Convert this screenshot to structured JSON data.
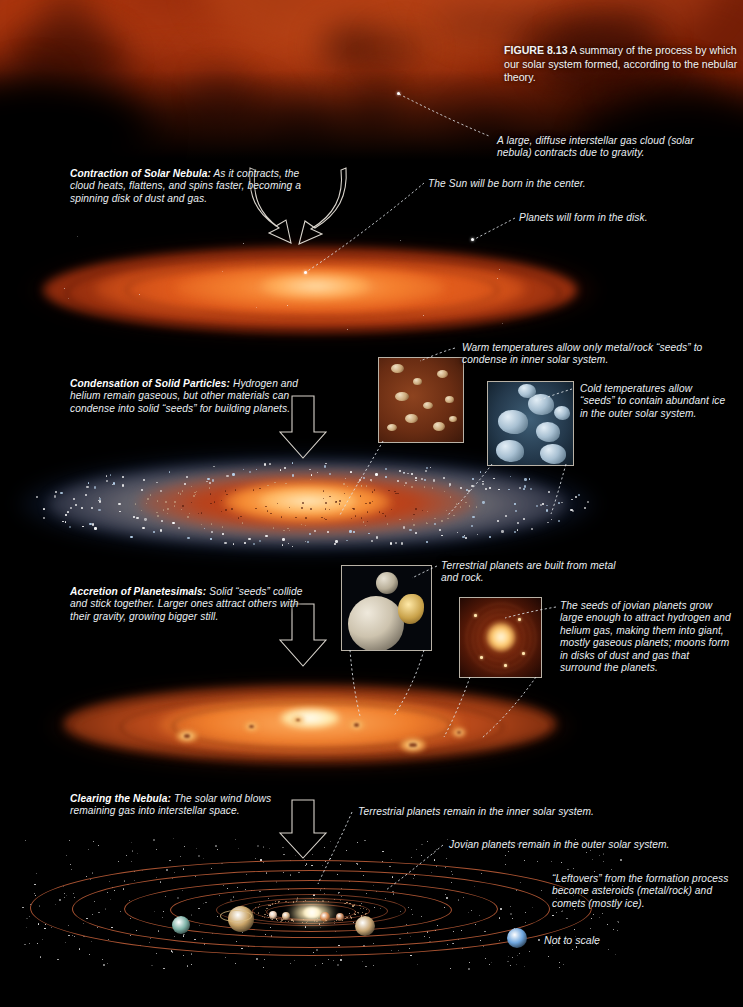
{
  "figure": {
    "number": "FIGURE 8.13",
    "caption": "A summary of the process by which our solar system formed, according to the nebular theory."
  },
  "stages": [
    {
      "id": "contraction",
      "title": "Contraction of Solar Nebula:",
      "body": " As it contracts, the cloud heats, flattens, and spins faster, becoming a spinning disk of dust and gas."
    },
    {
      "id": "condensation",
      "title": "Condensation of Solid Particles:",
      "body": " Hydrogen and helium remain gaseous, but other materials can condense into solid “seeds” for building planets."
    },
    {
      "id": "accretion",
      "title": "Accretion of Planetesimals:",
      "body": " Solid “seeds” collide and stick together. Larger ones attract others with their gravity, growing bigger still."
    },
    {
      "id": "clearing",
      "title": "Clearing the Nebula:",
      "body": " The solar wind blows remaining gas into interstellar space."
    }
  ],
  "annotations": {
    "gas_cloud": "A large, diffuse interstellar gas cloud (solar nebula) contracts due to gravity.",
    "sun_born": "The Sun will be born in the center.",
    "planets_form": "Planets will form in the disk.",
    "warm_seeds": "Warm temperatures allow only metal/rock “seeds” to condense in inner solar system.",
    "cold_seeds": "Cold temperatures allow “seeds” to contain abundant ice in the outer solar system.",
    "terrestrial_built": "Terrestrial planets are built from metal and rock.",
    "jovian_grow": "The seeds of jovian planets grow large enough to attract hydrogen and helium gas, making them into giant, mostly gaseous planets; moons form in disks of dust and gas that surround the planets.",
    "terrestrial_remain": "Terrestrial planets remain in the inner solar system.",
    "jovian_remain": "Jovian planets remain in the outer solar system.",
    "leftovers": "“Leftovers” from the formation process become asteroids (metal/rock) and comets (mostly ice).",
    "not_to_scale": "Not to scale"
  },
  "colors": {
    "background": "#000000",
    "nebula_red": "#a8300f",
    "nebula_deep": "#5e1606",
    "disk_orange": "#d4521c",
    "disk_core": "#ffd79a",
    "ice_blue": "#8fb6d8",
    "orbit_line": "#c4603a",
    "text": "#e9eef2",
    "inset_border": "#b9b2a6"
  }
}
